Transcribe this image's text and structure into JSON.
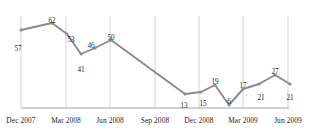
{
  "chart_data": {
    "type": "line",
    "title": "",
    "subtitle": "",
    "xlabel": "",
    "ylabel": "",
    "grid": "vertical-only",
    "legend": "none",
    "line_color": "#8a8a8a",
    "marker_color": "#8a8a8a",
    "axis_color": "#9a9a9a",
    "gridline_color": "#c9c9c9",
    "label_color": "#1f1f1f",
    "ylim": [
      0,
      70
    ],
    "axis_tick_labels": [
      "Dec 2007",
      "Mar 2008",
      "Jun 2008",
      "Sep 2008",
      "Dec 2008",
      "Mar 2009",
      "Jun 2009"
    ],
    "values": [
      57,
      62,
      53,
      41,
      46,
      50,
      13,
      15,
      19,
      6,
      17,
      21,
      27,
      21
    ],
    "points": [
      {
        "label": "57",
        "value": 57,
        "x": 21,
        "y": 30,
        "lx": 18,
        "ly": 45
      },
      {
        "label": "62",
        "value": 62,
        "x": 52,
        "y": 23,
        "lx": 52,
        "ly": 17
      },
      {
        "label": "53",
        "value": 53,
        "x": 67,
        "y": 34,
        "lx": 71,
        "ly": 36
      },
      {
        "label": "41",
        "value": 41,
        "x": 81,
        "y": 54,
        "lx": 81,
        "ly": 66
      },
      {
        "label": "46",
        "value": 46,
        "x": 95,
        "y": 48,
        "lx": 91,
        "ly": 42
      },
      {
        "label": "50",
        "value": 50,
        "x": 111,
        "y": 40,
        "lx": 111,
        "ly": 34
      },
      {
        "label": "13",
        "value": 13,
        "x": 185,
        "y": 94,
        "lx": 184,
        "ly": 102
      },
      {
        "label": "15",
        "value": 15,
        "x": 201,
        "y": 92,
        "lx": 203,
        "ly": 100
      },
      {
        "label": "19",
        "value": 19,
        "x": 215,
        "y": 85,
        "lx": 215,
        "ly": 78
      },
      {
        "label": "6",
        "value": 6,
        "x": 229,
        "y": 105,
        "lx": 229,
        "ly": 98
      },
      {
        "label": "17",
        "value": 17,
        "x": 243,
        "y": 89,
        "lx": 243,
        "ly": 82
      },
      {
        "label": "21",
        "value": 21,
        "x": 259,
        "y": 84,
        "lx": 261,
        "ly": 94
      },
      {
        "label": "27",
        "value": 27,
        "x": 275,
        "y": 75,
        "lx": 275,
        "ly": 68
      },
      {
        "label": "21",
        "value": 21,
        "x": 290,
        "y": 84,
        "lx": 290,
        "ly": 94
      }
    ],
    "gridlines_x": [
      21,
      66,
      110,
      155,
      199,
      243,
      288
    ],
    "axis_y": 108,
    "axis_x_start": 21,
    "axis_x_end": 289,
    "axis_top": 16
  }
}
